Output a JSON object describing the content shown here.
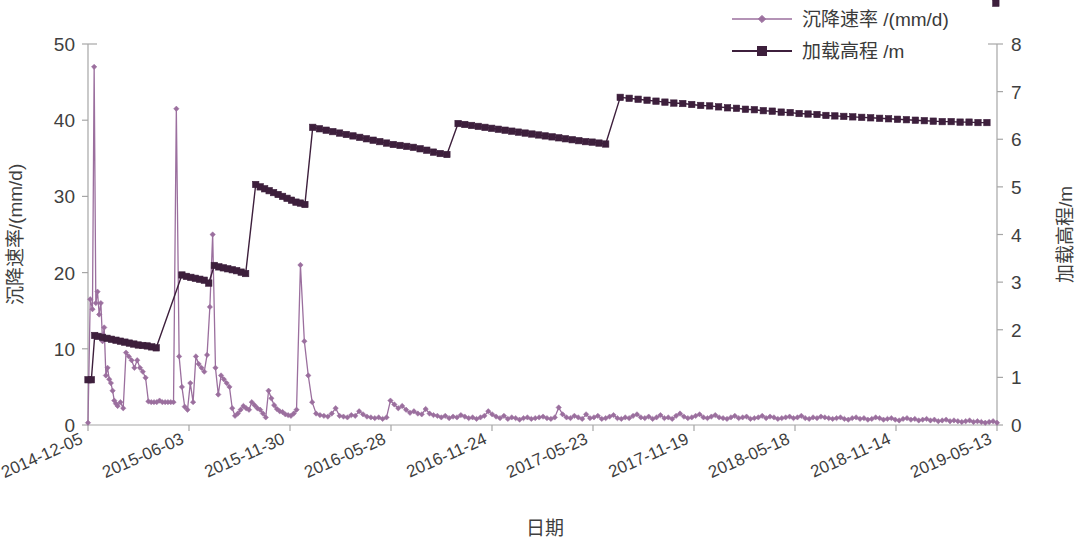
{
  "chart_data": {
    "type": "line",
    "title": "",
    "xlabel": "日期",
    "ylabel": "沉降速率/(mm/d)",
    "y2label": "加载高程/m",
    "grid": false,
    "legend_position": "top-right",
    "ylim": [
      0,
      50
    ],
    "y2lim": [
      0,
      8
    ],
    "yticks": [
      "0",
      "10",
      "20",
      "30",
      "40",
      "50"
    ],
    "y2ticks": [
      "0",
      "1",
      "2",
      "3",
      "4",
      "5",
      "6",
      "7",
      "8"
    ],
    "xticks": [
      "2014-12-05",
      "2015-06-03",
      "2015-11-30",
      "2016-05-28",
      "2016-11-24",
      "2017-05-23",
      "2017-11-19",
      "2018-05-18",
      "2018-11-14",
      "2019-05-13"
    ],
    "xlim": [
      "2014-12-05",
      "2019-05-13"
    ],
    "colors": {
      "settlement_rate": "#9b6f9e",
      "loading_elevation": "#3d1f3c",
      "axis": "#a6a6a6",
      "text": "#3f3f3f",
      "background": "#ffffff"
    },
    "series": [
      {
        "name": "沉降速率 /(mm/d)",
        "axis": "left",
        "unit": "mm/d",
        "marker": "diamond",
        "color": "#9b6f9e",
        "x_days": [
          0,
          4,
          8,
          11,
          14,
          17,
          20,
          23,
          26,
          29,
          32,
          35,
          38,
          41,
          44,
          47,
          50,
          53,
          58,
          63,
          68,
          73,
          78,
          83,
          88,
          93,
          98,
          103,
          108,
          113,
          118,
          123,
          128,
          133,
          138,
          143,
          148,
          153,
          158,
          163,
          168,
          173,
          178,
          183,
          188,
          193,
          198,
          203,
          208,
          213,
          218,
          223,
          228,
          233,
          238,
          243,
          248,
          253,
          258,
          263,
          268,
          273,
          278,
          283,
          288,
          293,
          298,
          303,
          308,
          313,
          318,
          323,
          328,
          333,
          338,
          343,
          348,
          353,
          358,
          363,
          368,
          373,
          380,
          387,
          394,
          401,
          408,
          415,
          422,
          429,
          436,
          443,
          450,
          457,
          464,
          471,
          478,
          485,
          492,
          499,
          506,
          513,
          520,
          527,
          534,
          541,
          548,
          555,
          562,
          569,
          576,
          583,
          590,
          597,
          604,
          611,
          618,
          625,
          632,
          639,
          646,
          653,
          660,
          667,
          674,
          681,
          688,
          695,
          702,
          709,
          716,
          723,
          730,
          737,
          744,
          751,
          758,
          765,
          772,
          779,
          786,
          793,
          800,
          807,
          814,
          821,
          828,
          835,
          842,
          849,
          856,
          863,
          870,
          877,
          884,
          891,
          898,
          905,
          912,
          919,
          926,
          933,
          940,
          947,
          954,
          961,
          968,
          975,
          982,
          989,
          996,
          1003,
          1010,
          1017,
          1024,
          1031,
          1038,
          1045,
          1052,
          1059,
          1066,
          1073,
          1080,
          1087,
          1094,
          1101,
          1108,
          1115,
          1122,
          1129,
          1136,
          1143,
          1150,
          1157,
          1164,
          1171,
          1178,
          1185,
          1192,
          1199,
          1206,
          1213,
          1220,
          1227,
          1234,
          1241,
          1248,
          1255,
          1262,
          1269,
          1276,
          1283,
          1290,
          1297,
          1304,
          1311,
          1318,
          1325,
          1332,
          1339,
          1346,
          1353,
          1360,
          1367,
          1374,
          1381,
          1388,
          1395,
          1402,
          1409,
          1416,
          1423,
          1430,
          1437,
          1444,
          1451,
          1458,
          1465,
          1472,
          1479,
          1486,
          1493,
          1500,
          1507,
          1514,
          1521,
          1528,
          1535,
          1542,
          1549,
          1556,
          1563,
          1570,
          1577,
          1584,
          1591,
          1598,
          1605,
          1612,
          1619,
          1626
        ],
        "values": [
          0.3,
          16.5,
          15.2,
          47.0,
          16.0,
          17.5,
          14.5,
          16.0,
          11.0,
          12.8,
          6.5,
          7.5,
          6.0,
          5.5,
          4.5,
          3.2,
          2.8,
          2.5,
          3.0,
          2.2,
          9.5,
          9.0,
          8.5,
          7.5,
          8.5,
          7.5,
          7.0,
          6.2,
          3.1,
          3.0,
          3.0,
          3.0,
          3.2,
          3.0,
          3.0,
          3.0,
          3.0,
          3.0,
          41.5,
          9.0,
          5.0,
          2.4,
          2.0,
          5.5,
          3.0,
          9.0,
          8.0,
          7.5,
          7.0,
          9.2,
          15.5,
          25.0,
          7.5,
          4.0,
          6.5,
          6.0,
          5.5,
          5.0,
          2.2,
          1.2,
          1.5,
          2.0,
          2.5,
          2.2,
          2.0,
          3.0,
          2.6,
          2.2,
          2.0,
          1.5,
          1.0,
          4.5,
          3.5,
          2.6,
          2.1,
          1.8,
          1.7,
          1.4,
          1.3,
          1.2,
          1.5,
          2.0,
          21.0,
          11.0,
          6.5,
          3.0,
          1.5,
          1.3,
          1.2,
          1.1,
          1.5,
          2.2,
          1.2,
          1.1,
          1.0,
          1.3,
          1.2,
          1.8,
          1.4,
          1.1,
          1.0,
          0.9,
          1.0,
          0.8,
          1.0,
          3.2,
          2.7,
          2.2,
          2.5,
          2.0,
          1.6,
          1.8,
          1.5,
          1.4,
          2.1,
          1.5,
          1.3,
          1.2,
          1.0,
          1.2,
          0.9,
          1.1,
          1.0,
          1.3,
          1.1,
          0.9,
          1.0,
          0.8,
          1.0,
          1.2,
          1.8,
          1.4,
          1.1,
          0.9,
          1.2,
          0.8,
          1.0,
          0.9,
          0.7,
          0.9,
          1.0,
          0.8,
          0.9,
          1.0,
          1.1,
          0.9,
          0.8,
          1.0,
          2.3,
          1.4,
          1.0,
          0.9,
          1.2,
          1.0,
          0.8,
          1.4,
          0.9,
          1.0,
          1.2,
          0.8,
          0.9,
          1.1,
          1.3,
          0.9,
          0.8,
          1.0,
          0.9,
          1.2,
          1.4,
          1.0,
          0.9,
          1.1,
          0.8,
          1.0,
          1.3,
          0.9,
          1.0,
          0.8,
          1.2,
          1.5,
          1.1,
          0.9,
          1.0,
          1.2,
          1.4,
          1.0,
          0.9,
          1.1,
          1.3,
          1.0,
          0.9,
          0.8,
          1.0,
          1.2,
          0.9,
          1.0,
          1.1,
          0.8,
          0.9,
          1.0,
          1.2,
          0.9,
          1.1,
          1.0,
          0.8,
          0.9,
          1.0,
          1.1,
          0.9,
          1.0,
          1.2,
          0.9,
          0.8,
          1.0,
          0.9,
          1.1,
          1.0,
          0.9,
          0.8,
          0.9,
          1.0,
          0.8,
          0.7,
          0.9,
          1.0,
          0.8,
          0.9,
          0.7,
          0.8,
          1.0,
          0.9,
          0.7,
          0.8,
          0.9,
          0.7,
          0.6,
          0.8,
          0.9,
          0.7,
          0.8,
          0.6,
          0.7,
          0.8,
          0.6,
          0.7,
          0.5,
          0.6,
          0.7,
          0.5,
          0.6,
          0.5,
          0.4,
          0.5,
          0.6,
          0.4,
          0.5,
          0.4,
          0.3,
          0.4,
          0.5,
          0.3,
          0.4,
          0.3,
          0.4,
          0.3,
          0.2,
          0.3,
          0.4,
          0.3,
          0.2,
          0.3
        ]
      },
      {
        "name": "加载高程 /m",
        "axis": "right",
        "unit": "m",
        "marker": "square",
        "color": "#3d1f3c",
        "steps": [
          {
            "start_day": 0,
            "top": 0.95,
            "end_day": 10,
            "end_value": 0.95
          },
          {
            "start_day": 12,
            "top": 1.88,
            "end_day": 120,
            "end_value": 1.62
          },
          {
            "start_day": 168,
            "top": 3.15,
            "end_day": 215,
            "end_value": 2.98
          },
          {
            "start_day": 225,
            "top": 3.35,
            "end_day": 285,
            "end_value": 3.18
          },
          {
            "start_day": 300,
            "top": 5.05,
            "end_day": 390,
            "end_value": 4.63
          },
          {
            "start_day": 400,
            "top": 6.25,
            "end_day": 640,
            "end_value": 5.68
          },
          {
            "start_day": 660,
            "top": 6.33,
            "end_day": 930,
            "end_value": 5.9
          },
          {
            "start_day": 950,
            "top": 6.88,
            "end_day": 1626,
            "end_value": 6.35
          }
        ],
        "x_days": [
          0,
          6,
          12,
          18,
          26,
          34,
          42,
          50,
          58,
          66,
          74,
          82,
          90,
          98,
          106,
          114,
          122,
          168,
          176,
          184,
          192,
          200,
          208,
          216,
          226,
          234,
          242,
          250,
          258,
          266,
          274,
          282,
          300,
          308,
          316,
          324,
          332,
          340,
          348,
          356,
          364,
          372,
          380,
          388,
          402,
          414,
          426,
          438,
          450,
          462,
          474,
          486,
          498,
          510,
          522,
          534,
          546,
          558,
          570,
          582,
          594,
          606,
          618,
          630,
          642,
          662,
          674,
          686,
          698,
          710,
          722,
          734,
          746,
          758,
          770,
          782,
          794,
          806,
          818,
          830,
          842,
          854,
          866,
          878,
          890,
          902,
          914,
          926,
          952,
          968,
          984,
          1000,
          1016,
          1032,
          1048,
          1064,
          1080,
          1096,
          1112,
          1128,
          1144,
          1160,
          1176,
          1192,
          1208,
          1224,
          1240,
          1256,
          1272,
          1288,
          1304,
          1320,
          1336,
          1352,
          1368,
          1384,
          1400,
          1416,
          1432,
          1448,
          1464,
          1480,
          1496,
          1512,
          1528,
          1544,
          1560,
          1576,
          1592,
          1608,
          1624
        ],
        "values": [
          0.95,
          0.95,
          1.88,
          1.86,
          1.84,
          1.82,
          1.8,
          1.78,
          1.76,
          1.74,
          1.72,
          1.7,
          1.68,
          1.67,
          1.66,
          1.64,
          1.62,
          3.15,
          3.12,
          3.1,
          3.08,
          3.06,
          3.04,
          2.98,
          3.35,
          3.32,
          3.3,
          3.28,
          3.26,
          3.24,
          3.21,
          3.18,
          5.05,
          5.0,
          4.96,
          4.92,
          4.88,
          4.84,
          4.8,
          4.76,
          4.72,
          4.68,
          4.66,
          4.63,
          6.25,
          6.22,
          6.19,
          6.16,
          6.13,
          6.1,
          6.07,
          6.04,
          6.01,
          5.98,
          5.95,
          5.92,
          5.89,
          5.87,
          5.85,
          5.83,
          5.8,
          5.77,
          5.73,
          5.7,
          5.68,
          6.33,
          6.31,
          6.29,
          6.27,
          6.25,
          6.23,
          6.21,
          6.19,
          6.17,
          6.15,
          6.13,
          6.11,
          6.09,
          6.07,
          6.05,
          6.03,
          6.01,
          5.99,
          5.97,
          5.95,
          5.94,
          5.92,
          5.9,
          6.88,
          6.86,
          6.84,
          6.82,
          6.8,
          6.78,
          6.76,
          6.75,
          6.73,
          6.71,
          6.7,
          6.68,
          6.66,
          6.65,
          6.63,
          6.62,
          6.6,
          6.59,
          6.57,
          6.56,
          6.54,
          6.53,
          6.52,
          6.5,
          6.49,
          6.48,
          6.47,
          6.46,
          6.45,
          6.44,
          6.43,
          6.42,
          6.41,
          6.4,
          6.39,
          6.38,
          6.37,
          6.37,
          6.36,
          6.36,
          6.35,
          6.35
        ]
      }
    ]
  },
  "legend": {
    "items": [
      {
        "label": "沉降速率 /(mm/d)",
        "color": "#9b6f9e",
        "marker": "diamond"
      },
      {
        "label": "加载高程 /m",
        "color": "#3d1f3c",
        "marker": "square"
      }
    ]
  },
  "axes": {
    "left_title": "沉降速率/(mm/d)",
    "right_title": "加载高程/m",
    "bottom_title": "日期"
  }
}
